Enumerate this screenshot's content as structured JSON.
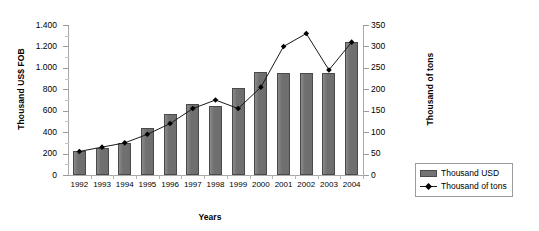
{
  "chart_data": {
    "type": "bar",
    "title": "",
    "xlabel": "Years",
    "ylabel": "Thousand US$ FOB",
    "y2label": "Thousand of tons",
    "categories": [
      "1992",
      "1993",
      "1994",
      "1995",
      "1996",
      "1997",
      "1998",
      "1999",
      "2000",
      "2001",
      "2002",
      "2003",
      "2004"
    ],
    "series": [
      {
        "name": "Thousand USD",
        "type": "bar",
        "axis": "left",
        "values": [
          220,
          255,
          300,
          440,
          570,
          660,
          640,
          810,
          965,
          950,
          955,
          950,
          1245
        ]
      },
      {
        "name": "Thousand of tons",
        "type": "line",
        "axis": "right",
        "values": [
          55,
          65,
          75,
          95,
          120,
          155,
          175,
          155,
          205,
          300,
          330,
          245,
          310
        ]
      }
    ],
    "ylim": [
      0,
      1400
    ],
    "y2lim": [
      0,
      350
    ],
    "yticks": [
      "0",
      "200",
      "400",
      "600",
      "800",
      "1.000",
      "1.200",
      "1.400"
    ],
    "ytick_values": [
      0,
      200,
      400,
      600,
      800,
      1000,
      1200,
      1400
    ],
    "y2ticks": [
      "0",
      "50",
      "100",
      "150",
      "200",
      "250",
      "300",
      "350"
    ],
    "y2tick_values": [
      0,
      50,
      100,
      150,
      200,
      250,
      300,
      350
    ],
    "grid": false,
    "legend_position": "right",
    "legend": [
      "Thousand USD",
      "Thousand of tons"
    ],
    "colors": {
      "bar_fill": "#737373",
      "bar_border": "#4a4a4a",
      "line": "#1a1a1a",
      "marker": "#000000",
      "axis": "#a9a9a9",
      "background": "#ffffff"
    }
  }
}
